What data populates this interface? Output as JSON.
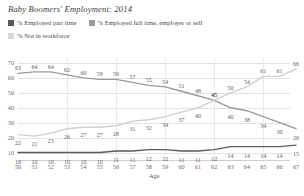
{
  "title": "Baby Boomers' Employment: 2014",
  "legend": {
    "position": "top-left",
    "items": [
      {
        "label": "% Employed part time",
        "color": "#5a5a5a",
        "key": "part_time"
      },
      {
        "label": "% Employed full time, employer or self",
        "color": "#9a9a9a",
        "key": "full_time"
      },
      {
        "label": "% Not in workforce",
        "color": "#d0d0d0",
        "key": "not_in_workforce"
      }
    ]
  },
  "chart_data": {
    "type": "line",
    "title": "Baby Boomers' Employment: 2014",
    "xlabel": "Age",
    "ylabel": "",
    "grid": true,
    "xlim": [
      50,
      67
    ],
    "ylim": [
      5,
      72
    ],
    "yticks": [
      10,
      20,
      30,
      40,
      50,
      60,
      70
    ],
    "categories": [
      50,
      51,
      52,
      53,
      54,
      55,
      56,
      57,
      58,
      59,
      60,
      61,
      62,
      63,
      64,
      65,
      66,
      67
    ],
    "x": [
      50,
      51,
      52,
      53,
      54,
      55,
      56,
      57,
      58,
      59,
      60,
      61,
      62,
      63,
      64,
      65,
      66,
      67
    ],
    "series": [
      {
        "name": "% Employed full time, employer or self",
        "color": "#9a9a9a",
        "values": [
          63,
          64,
          64,
          62,
          60,
          59,
          59,
          57,
          55,
          54,
          51,
          48,
          45,
          40,
          38,
          34,
          30,
          26
        ]
      },
      {
        "name": "% Not in workforce",
        "color": "#d0d0d0",
        "values": [
          22,
          21,
          23,
          26,
          27,
          27,
          28,
          31,
          32,
          34,
          37,
          40,
          45,
          50,
          54,
          61,
          61,
          66
        ]
      },
      {
        "name": "% Employed part time",
        "color": "#5a5a5a",
        "values": [
          10,
          10,
          10,
          10,
          10,
          10,
          11,
          11,
          12,
          12,
          11,
          11,
          12,
          14,
          14,
          14,
          14,
          15
        ]
      }
    ]
  }
}
